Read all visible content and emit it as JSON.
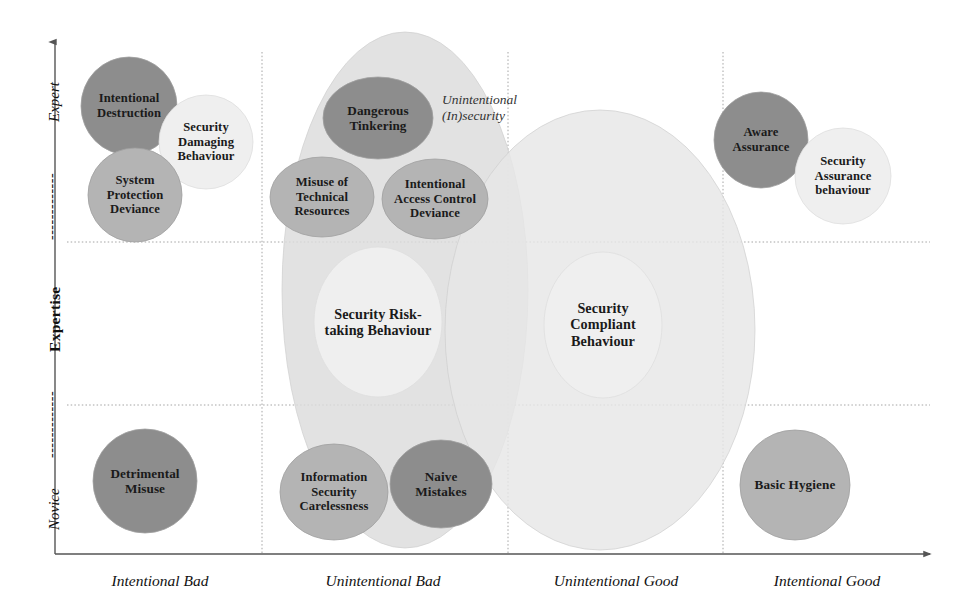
{
  "figure": {
    "colors": {
      "dark": "#8d8d8d",
      "medium": "#b4b4b4",
      "light": "#efefef",
      "cloud_left": "#dcdcdc",
      "cloud_right": "#e6e6e6",
      "axis": "#555555",
      "grid": "#9a9a9a",
      "text": "#1a1a1a"
    }
  },
  "axes": {
    "y": {
      "low_label": "Novice",
      "title": "Expertise",
      "high_label": "Expert",
      "dash": "-------------"
    },
    "x": {
      "categories": [
        "Intentional Bad",
        "Unintentional Bad",
        "Unintentional Good",
        "Intentional Good"
      ]
    }
  },
  "cloud": {
    "label": "Unintentional\n(In)security"
  },
  "bubbles": [
    {
      "name": "intentional-destruction",
      "label": "Intentional\nDestruction",
      "cx": 129,
      "cy": 106,
      "rx": 48,
      "ry": 49,
      "tone": "dark",
      "font": 12.6
    },
    {
      "name": "security-damaging-behaviour",
      "label": "Security\nDamaging\nBehaviour",
      "cx": 206,
      "cy": 142,
      "rx": 47,
      "ry": 47,
      "tone": "light",
      "font": 12.6
    },
    {
      "name": "system-protection-deviance",
      "label": "System\nProtection\nDeviance",
      "cx": 135,
      "cy": 195,
      "rx": 47,
      "ry": 47,
      "tone": "medium",
      "font": 12.6
    },
    {
      "name": "dangerous-tinkering",
      "label": "Dangerous\nTinkering",
      "cx": 378,
      "cy": 118,
      "rx": 55,
      "ry": 41,
      "tone": "dark",
      "font": 13.2
    },
    {
      "name": "misuse-of-technical-resources",
      "label": "Misuse of\nTechnical\nResources",
      "cx": 322,
      "cy": 197,
      "rx": 52,
      "ry": 40,
      "tone": "medium",
      "font": 12.6
    },
    {
      "name": "intentional-access-control-deviance",
      "label": "Intentional\nAccess Control\nDeviance",
      "cx": 435,
      "cy": 199,
      "rx": 53,
      "ry": 40,
      "tone": "medium",
      "font": 12.6
    },
    {
      "name": "security-risk-taking-behaviour",
      "label": "Security Risk-\ntaking Behaviour",
      "cx": 378,
      "cy": 322,
      "rx": 64,
      "ry": 75,
      "tone": "light",
      "font": 14.2
    },
    {
      "name": "security-compliant-behaviour",
      "label": "Security\nCompliant\nBehaviour",
      "cx": 603,
      "cy": 325,
      "rx": 59,
      "ry": 73,
      "tone": "light",
      "font": 14.2
    },
    {
      "name": "information-security-carelessness",
      "label": "Information\nSecurity\nCarelessness",
      "cx": 334,
      "cy": 492,
      "rx": 54,
      "ry": 48,
      "tone": "medium",
      "font": 12.6
    },
    {
      "name": "naive-mistakes",
      "label": "Naive\nMistakes",
      "cx": 441,
      "cy": 484,
      "rx": 51,
      "ry": 44,
      "tone": "dark",
      "font": 13.2
    },
    {
      "name": "detrimental-misuse",
      "label": "Detrimental\nMisuse",
      "cx": 145,
      "cy": 481,
      "rx": 52,
      "ry": 52,
      "tone": "dark",
      "font": 13.2
    },
    {
      "name": "aware-assurance",
      "label": "Aware\nAssurance",
      "cx": 761,
      "cy": 140,
      "rx": 47,
      "ry": 48,
      "tone": "dark",
      "font": 12.6
    },
    {
      "name": "security-assurance-behaviour",
      "label": "Security\nAssurance\nbehaviour",
      "cx": 843,
      "cy": 176,
      "rx": 48,
      "ry": 48,
      "tone": "light",
      "font": 12.6
    },
    {
      "name": "basic-hygiene",
      "label": "Basic Hygiene",
      "cx": 795,
      "cy": 485,
      "rx": 55,
      "ry": 55,
      "tone": "medium",
      "font": 13.2
    }
  ],
  "clouds": [
    {
      "name": "unintentional-insecurity-left",
      "cx": 405,
      "cy": 290,
      "rx": 123,
      "ry": 258,
      "tone": "cloud_left"
    },
    {
      "name": "unintentional-insecurity-right",
      "cx": 600,
      "cy": 330,
      "rx": 155,
      "ry": 220,
      "tone": "cloud_right"
    }
  ],
  "gridlines": {
    "horizontal": [
      242,
      405
    ],
    "vertical": [
      262,
      508,
      723
    ]
  },
  "axis_geometry": {
    "origin_x": 55,
    "origin_y": 554,
    "top_y": 42,
    "right_x": 930,
    "category_x": [
      160,
      383,
      616,
      827
    ],
    "category_y": 572
  }
}
